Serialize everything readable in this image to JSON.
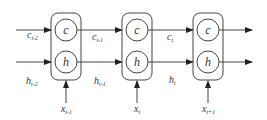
{
  "diagram": {
    "type": "lstm-unrolled",
    "colors": {
      "stroke": "#333333",
      "background": "#ffffff"
    },
    "cells": [
      {
        "id": "cell-t-1",
        "top_node": "c",
        "bottom_node": "h",
        "input_label": "x",
        "input_sub": "t-1"
      },
      {
        "id": "cell-t",
        "top_node": "c",
        "bottom_node": "h",
        "input_label": "x",
        "input_sub": "t"
      },
      {
        "id": "cell-t+1",
        "top_node": "c",
        "bottom_node": "h",
        "input_label": "x",
        "input_sub": "t+1"
      }
    ],
    "edges": [
      {
        "label": "c",
        "sub": "t-2"
      },
      {
        "label": "h",
        "sub": "t-2"
      },
      {
        "label": "c",
        "sub": "t-1"
      },
      {
        "label": "h",
        "sub": "t-1"
      },
      {
        "label": "c",
        "sub": "t"
      },
      {
        "label": "h",
        "sub": "t"
      }
    ]
  }
}
